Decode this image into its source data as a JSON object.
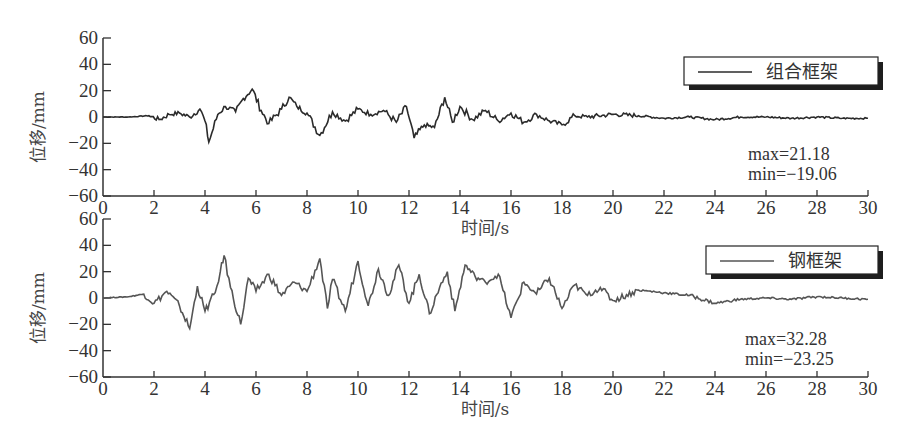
{
  "chart_data": [
    {
      "type": "line",
      "title": "",
      "legend": [
        "组合框架"
      ],
      "legend_position": "upper right",
      "xlabel": "时间/s",
      "ylabel": "位移/mm",
      "xlim": [
        0,
        30
      ],
      "ylim": [
        -60,
        60
      ],
      "xticks": [
        0,
        2,
        4,
        6,
        8,
        10,
        12,
        14,
        16,
        18,
        20,
        22,
        24,
        26,
        28,
        30
      ],
      "yticks": [
        -60,
        -40,
        -20,
        0,
        20,
        40,
        60
      ],
      "grid": false,
      "annotations": [
        "max=21.18",
        "min=-19.06"
      ],
      "series": [
        {
          "name": "组合框架",
          "color": "#2b2b2b",
          "x": [
            0,
            1,
            1.8,
            2.2,
            2.6,
            3.0,
            3.4,
            3.8,
            4.0,
            4.15,
            4.5,
            4.8,
            5.2,
            5.5,
            5.85,
            6.2,
            6.5,
            7.0,
            7.3,
            7.6,
            8.0,
            8.5,
            9.0,
            9.5,
            10.0,
            10.5,
            11.0,
            11.5,
            11.9,
            12.2,
            12.6,
            13.0,
            13.4,
            13.7,
            14.0,
            14.5,
            15.0,
            15.5,
            16.0,
            16.5,
            17.0,
            17.5,
            18.0,
            18.5,
            19.0,
            20.0,
            21.0,
            22.0,
            23.0,
            24.0,
            25.0,
            26.0,
            27.0,
            28.0,
            29.0,
            30.0
          ],
          "y": [
            0,
            0,
            1,
            -2,
            2,
            3,
            0,
            6,
            -3,
            -19.06,
            2,
            8,
            4,
            14,
            21.18,
            5,
            -5,
            6,
            15,
            8,
            3,
            -14,
            4,
            -3,
            6,
            2,
            5,
            -4,
            8,
            -16,
            -6,
            -8,
            15,
            -4,
            8,
            -2,
            5,
            -3,
            3,
            -4,
            2,
            -3,
            -6,
            1,
            0,
            2,
            1,
            -1,
            0,
            -2,
            0,
            0,
            -1,
            0,
            -1,
            -1
          ]
        }
      ]
    },
    {
      "type": "line",
      "title": "",
      "legend": [
        "钢框架"
      ],
      "legend_position": "upper right",
      "xlabel": "时间/s",
      "ylabel": "位移/mm",
      "xlim": [
        0,
        30
      ],
      "ylim": [
        -60,
        60
      ],
      "xticks": [
        0,
        2,
        4,
        6,
        8,
        10,
        12,
        14,
        16,
        18,
        20,
        22,
        24,
        26,
        28,
        30
      ],
      "yticks": [
        -60,
        -40,
        -20,
        0,
        20,
        40,
        60
      ],
      "grid": false,
      "annotations": [
        "max=32.28",
        "min=-23.25"
      ],
      "series": [
        {
          "name": "钢框架",
          "color": "#555555",
          "x": [
            0,
            1,
            1.6,
            2.0,
            2.5,
            3.0,
            3.4,
            3.7,
            4.0,
            4.4,
            4.6,
            4.75,
            5.0,
            5.4,
            5.7,
            6.0,
            6.5,
            7.0,
            7.5,
            8.0,
            8.5,
            8.8,
            9.0,
            9.5,
            10.0,
            10.4,
            10.8,
            11.2,
            11.6,
            12.0,
            12.4,
            12.8,
            13.2,
            13.5,
            13.8,
            14.2,
            14.6,
            15.0,
            15.5,
            16.0,
            16.5,
            17.0,
            17.5,
            18.0,
            18.5,
            19.0,
            19.5,
            20.0,
            21.0,
            22.0,
            23.0,
            24.0,
            25.0,
            26.0,
            27.0,
            28.0,
            29.0,
            30.0
          ],
          "y": [
            0,
            1,
            3,
            -4,
            5,
            -6,
            -23.25,
            9,
            -10,
            4,
            20,
            32.28,
            8,
            -20,
            15,
            5,
            18,
            2,
            12,
            5,
            30,
            -8,
            14,
            -10,
            28,
            -6,
            22,
            2,
            25,
            -4,
            18,
            -12,
            8,
            20,
            -10,
            25,
            16,
            12,
            18,
            -15,
            12,
            3,
            15,
            -8,
            10,
            2,
            8,
            -2,
            6,
            4,
            2,
            -4,
            -1,
            0,
            -1,
            1,
            0,
            -1
          ]
        }
      ]
    }
  ],
  "panels": [
    {
      "legend_label": "组合框架",
      "ylabel": "位移/mm",
      "xlabel": "时间/s",
      "max_text": "max=21.18",
      "min_text": "min=−19.06"
    },
    {
      "legend_label": "钢框架",
      "ylabel": "位移/mm",
      "xlabel": "时间/s",
      "max_text": "max=32.28",
      "min_text": "min=−23.25"
    }
  ],
  "ytick_labels": [
    "60",
    "40",
    "20",
    "0",
    "−20",
    "−40",
    "−60"
  ],
  "xtick_labels": [
    "0",
    "2",
    "4",
    "6",
    "8",
    "10",
    "12",
    "14",
    "16",
    "18",
    "20",
    "22",
    "24",
    "26",
    "28",
    "30"
  ]
}
